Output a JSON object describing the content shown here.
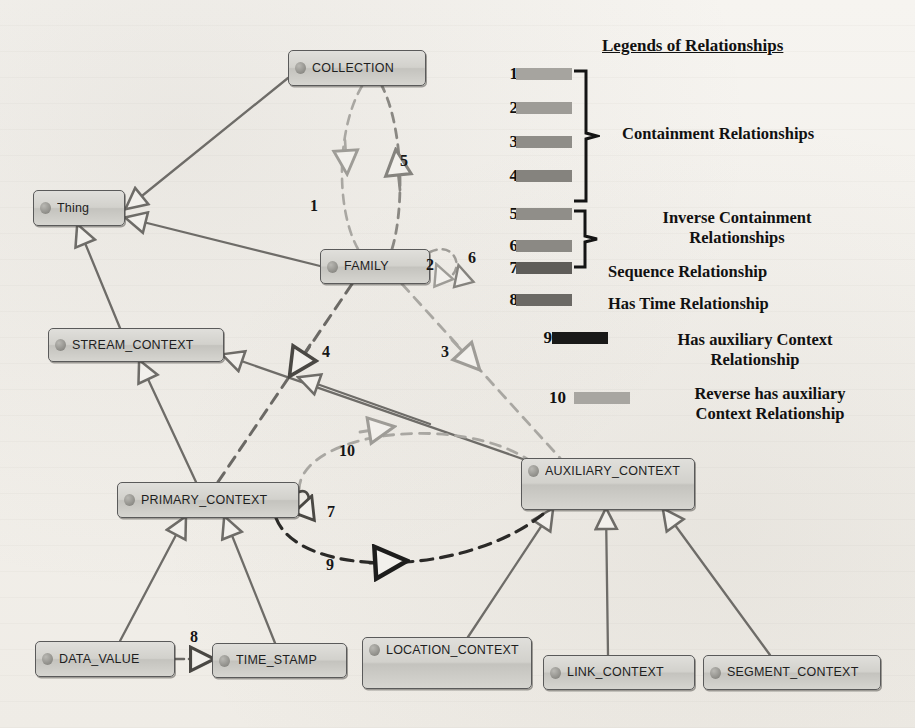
{
  "diagram": {
    "nodes": [
      {
        "id": "collection",
        "label": "COLLECTION",
        "x": 288,
        "y": 50,
        "w": 138,
        "h": 36,
        "lines": 1
      },
      {
        "id": "thing",
        "label": "Thing",
        "x": 33,
        "y": 190,
        "w": 92,
        "h": 36,
        "lines": 1
      },
      {
        "id": "family",
        "label": "FAMILY",
        "x": 320,
        "y": 249,
        "w": 110,
        "h": 35,
        "lines": 1
      },
      {
        "id": "stream_context",
        "label": "STREAM_CONTEXT",
        "x": 48,
        "y": 328,
        "w": 176,
        "h": 34,
        "lines": 1
      },
      {
        "id": "primary_context",
        "label": "PRIMARY_CONTEXT",
        "x": 117,
        "y": 482,
        "w": 182,
        "h": 36,
        "lines": 1
      },
      {
        "id": "auxiliary_context",
        "label": "AUXILIARY_CONTEXT",
        "x": 521,
        "y": 458,
        "w": 174,
        "h": 52,
        "lines": 2
      },
      {
        "id": "data_value",
        "label": "DATA_VALUE",
        "x": 35,
        "y": 641,
        "w": 140,
        "h": 36,
        "lines": 1
      },
      {
        "id": "time_stamp",
        "label": "TIME_STAMP",
        "x": 212,
        "y": 643,
        "w": 135,
        "h": 35,
        "lines": 1
      },
      {
        "id": "location_context",
        "label": "LOCATION_CONTEXT",
        "x": 362,
        "y": 637,
        "w": 170,
        "h": 52,
        "lines": 2
      },
      {
        "id": "link_context",
        "label": "LINK_CONTEXT",
        "x": 543,
        "y": 655,
        "w": 152,
        "h": 35,
        "lines": 1
      },
      {
        "id": "segment_context",
        "label": "SEGMENT_CONTEXT",
        "x": 703,
        "y": 655,
        "w": 178,
        "h": 35,
        "lines": 1
      }
    ],
    "edge_labels": [
      {
        "n": "1",
        "x": 310,
        "y": 197
      },
      {
        "n": "5",
        "x": 400,
        "y": 152
      },
      {
        "n": "2",
        "x": 426,
        "y": 256
      },
      {
        "n": "6",
        "x": 468,
        "y": 249
      },
      {
        "n": "4",
        "x": 322,
        "y": 343
      },
      {
        "n": "3",
        "x": 441,
        "y": 343
      },
      {
        "n": "10",
        "x": 339,
        "y": 442
      },
      {
        "n": "7",
        "x": 327,
        "y": 503
      },
      {
        "n": "9",
        "x": 326,
        "y": 556
      },
      {
        "n": "8",
        "x": 190,
        "y": 628
      }
    ]
  },
  "legend": {
    "title": "Legends of Relationships",
    "items": [
      {
        "num": "1",
        "color": "#a6a49f",
        "group": "containment"
      },
      {
        "num": "2",
        "color": "#9e9c97",
        "group": "containment"
      },
      {
        "num": "3",
        "color": "#8f8d88",
        "group": "containment"
      },
      {
        "num": "4",
        "color": "#85837e",
        "group": "containment"
      },
      {
        "num": "5",
        "color": "#908e89",
        "group": "inverse"
      },
      {
        "num": "6",
        "color": "#8b8984",
        "group": "inverse"
      },
      {
        "num": "7",
        "color": "#5f5d59",
        "group": "sequence"
      },
      {
        "num": "8",
        "color": "#6b6965",
        "group": "hastime"
      },
      {
        "num": "9",
        "color": "#191918",
        "group": "hasaux"
      },
      {
        "num": "10",
        "color": "#a8a6a1",
        "group": "revaux"
      }
    ],
    "groups": {
      "containment": "Containment Relationships",
      "inverse_line1": "Inverse Containment",
      "inverse_line2": "Relationships",
      "sequence": "Sequence Relationship",
      "hastime": "Has Time Relationship",
      "hasaux_line1": "Has auxiliary Context",
      "hasaux_line2": "Relationship",
      "revaux_line1": "Reverse has auxiliary",
      "revaux_line2": "Context Relationship"
    }
  },
  "colors": {
    "node_border": "#5a5a5a",
    "solid_edge": "#6e6c68",
    "dashed_light": "#a9a7a2",
    "dashed_mid": "#8a8883",
    "dashed_dark": "#4a4844",
    "dashed_black": "#1d1d1c",
    "paper": "#f4f2ee"
  }
}
